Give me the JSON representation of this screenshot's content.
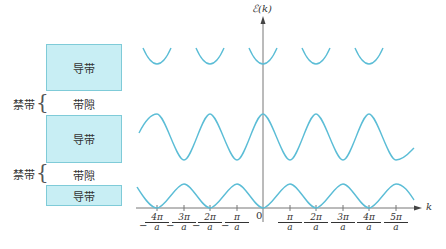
{
  "band_diagram": {
    "bands": [
      {
        "label": "导带",
        "type": "allowed"
      },
      {
        "label": "带隙",
        "type": "gap",
        "bracket_label": "禁带"
      },
      {
        "label": "导带",
        "type": "allowed"
      },
      {
        "label": "带隙",
        "type": "gap",
        "bracket_label": "禁带"
      },
      {
        "label": "导带",
        "type": "allowed"
      }
    ]
  },
  "plot": {
    "y_axis_label": "ℰ(k)",
    "x_axis_label": "k",
    "origin_label": "0",
    "ticks": [
      {
        "num": "4π",
        "den": "a",
        "sign": "−"
      },
      {
        "num": "3π",
        "den": "a",
        "sign": "−"
      },
      {
        "num": "2π",
        "den": "a",
        "sign": "−"
      },
      {
        "num": "π",
        "den": "a",
        "sign": "−"
      },
      {
        "num": "π",
        "den": "a",
        "sign": ""
      },
      {
        "num": "2π",
        "den": "a",
        "sign": ""
      },
      {
        "num": "3π",
        "den": "a",
        "sign": ""
      },
      {
        "num": "4π",
        "den": "a",
        "sign": ""
      },
      {
        "num": "5π",
        "den": "a",
        "sign": ""
      }
    ],
    "curve_color": "#5bbdd6",
    "curves": [
      {
        "name": "top band",
        "shape": "parabolic segments, minima at k = 2nπ/a"
      },
      {
        "name": "middle band",
        "shape": "cosine, maxima at k = 2nπ/a"
      },
      {
        "name": "bottom band",
        "shape": "1 − cos, minima at k = 2nπ/a"
      }
    ]
  }
}
